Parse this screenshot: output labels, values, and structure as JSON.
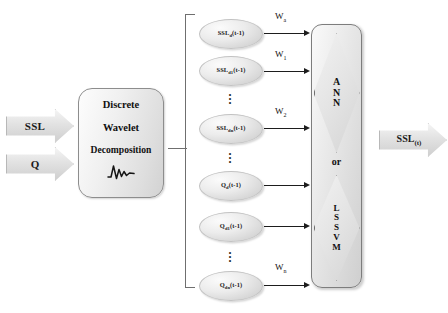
{
  "diagram": {
    "inputs": [
      {
        "id": "ssl",
        "label": "SSL",
        "icon": "arrow-right-chevron"
      },
      {
        "id": "q",
        "label": "Q",
        "icon": "arrow-right-chevron"
      }
    ],
    "processor": {
      "lines": [
        "Discrete",
        "Wavelet",
        "Decomposition"
      ],
      "icon": "wavelet-squiggle-icon"
    },
    "bracket": {
      "icon": "square-bracket-open"
    },
    "nodes": [
      {
        "id": "ssl-d",
        "base": "SSL",
        "sub": "d",
        "suffix": "(t-1)"
      },
      {
        "id": "ssl-d1",
        "base": "SSL",
        "sub": "d1",
        "suffix": "(t-1)"
      },
      {
        "id": "ssl-dn",
        "base": "SSL",
        "sub": "dn",
        "suffix": "(t-1)"
      },
      {
        "id": "q-d",
        "base": "Q",
        "sub": "d",
        "suffix": "(t-1)"
      },
      {
        "id": "q-d1",
        "base": "Q",
        "sub": "d1",
        "suffix": "(t-1)"
      },
      {
        "id": "q-dn",
        "base": "Q",
        "sub": "dn",
        "suffix": "(t-1)"
      }
    ],
    "ellipsis": "⋮",
    "weights": [
      {
        "id": "w-a",
        "base": "W",
        "sub": "a"
      },
      {
        "id": "w-1",
        "base": "W",
        "sub": "1"
      },
      {
        "id": "w-2",
        "base": "W",
        "sub": "2"
      },
      {
        "id": "w-n",
        "base": "W",
        "sub": "n"
      }
    ],
    "model": {
      "ann": {
        "letters": [
          "A",
          "N",
          "N"
        ]
      },
      "or_label": "or",
      "lssvm": {
        "letters": [
          "L",
          "S",
          "S",
          "V",
          "M"
        ]
      }
    },
    "output": {
      "id": "ssl-t",
      "base": "SSL",
      "sub": "(t)",
      "label": "SSL"
    },
    "colors": {
      "line": "#1d1d1d",
      "node_fill": "#e6e6e6",
      "node_stroke": "#c2c2c2",
      "box_stroke": "#7d7d7d",
      "text": "#111111",
      "background": "#ffffff"
    }
  }
}
